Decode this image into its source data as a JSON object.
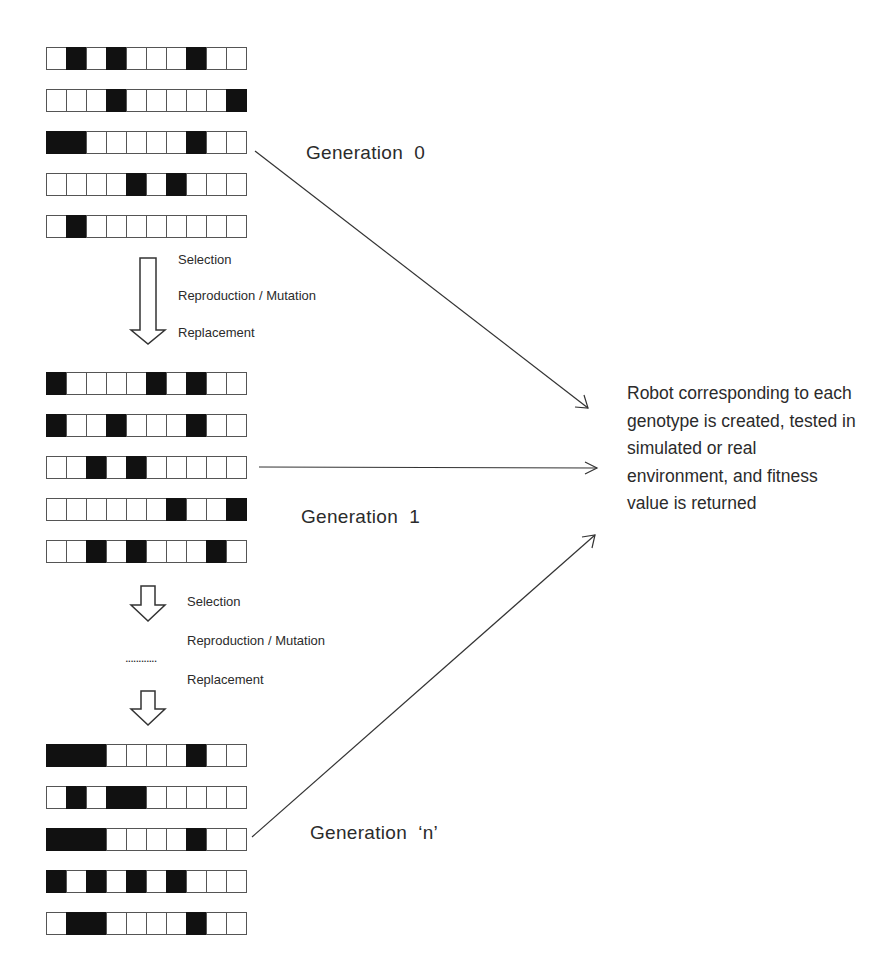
{
  "generations": [
    {
      "label": "Generation  0",
      "rows": [
        [
          0,
          1,
          0,
          1,
          0,
          0,
          0,
          1,
          0,
          0
        ],
        [
          0,
          0,
          0,
          1,
          0,
          0,
          0,
          0,
          0,
          1
        ],
        [
          1,
          1,
          0,
          0,
          0,
          0,
          0,
          1,
          0,
          0
        ],
        [
          0,
          0,
          0,
          0,
          1,
          0,
          1,
          0,
          0,
          0
        ],
        [
          0,
          1,
          0,
          0,
          0,
          0,
          0,
          0,
          0,
          0
        ]
      ]
    },
    {
      "label": "Generation  1",
      "rows": [
        [
          1,
          0,
          0,
          0,
          0,
          1,
          0,
          1,
          0,
          0
        ],
        [
          1,
          0,
          0,
          1,
          0,
          0,
          0,
          1,
          0,
          0
        ],
        [
          0,
          0,
          1,
          0,
          1,
          0,
          0,
          0,
          0,
          0
        ],
        [
          0,
          0,
          0,
          0,
          0,
          0,
          1,
          0,
          0,
          1
        ],
        [
          0,
          0,
          1,
          0,
          1,
          0,
          0,
          0,
          1,
          0
        ]
      ]
    },
    {
      "label": "Generation  ‘n’",
      "rows": [
        [
          1,
          1,
          1,
          0,
          0,
          0,
          0,
          1,
          0,
          0
        ],
        [
          0,
          1,
          0,
          1,
          1,
          0,
          0,
          0,
          0,
          0
        ],
        [
          1,
          1,
          1,
          0,
          0,
          0,
          0,
          1,
          0,
          0
        ],
        [
          1,
          0,
          1,
          0,
          1,
          0,
          1,
          0,
          0,
          0
        ],
        [
          0,
          1,
          1,
          0,
          0,
          0,
          0,
          1,
          0,
          0
        ]
      ]
    }
  ],
  "operations_1": {
    "selection": "Selection",
    "reproduction": "Reproduction / Mutation",
    "replacement": "Replacement"
  },
  "operations_2": {
    "selection": "Selection",
    "reproduction": "Reproduction / Mutation",
    "ellipsis": "............",
    "replacement": "Replacement"
  },
  "result_text": "Robot corresponding to each genotype is created, tested in simulated or real environment, and fitness value is returned",
  "colors": {
    "gene_on": "#111111",
    "gene_off": "#ffffff",
    "line": "#333333"
  }
}
